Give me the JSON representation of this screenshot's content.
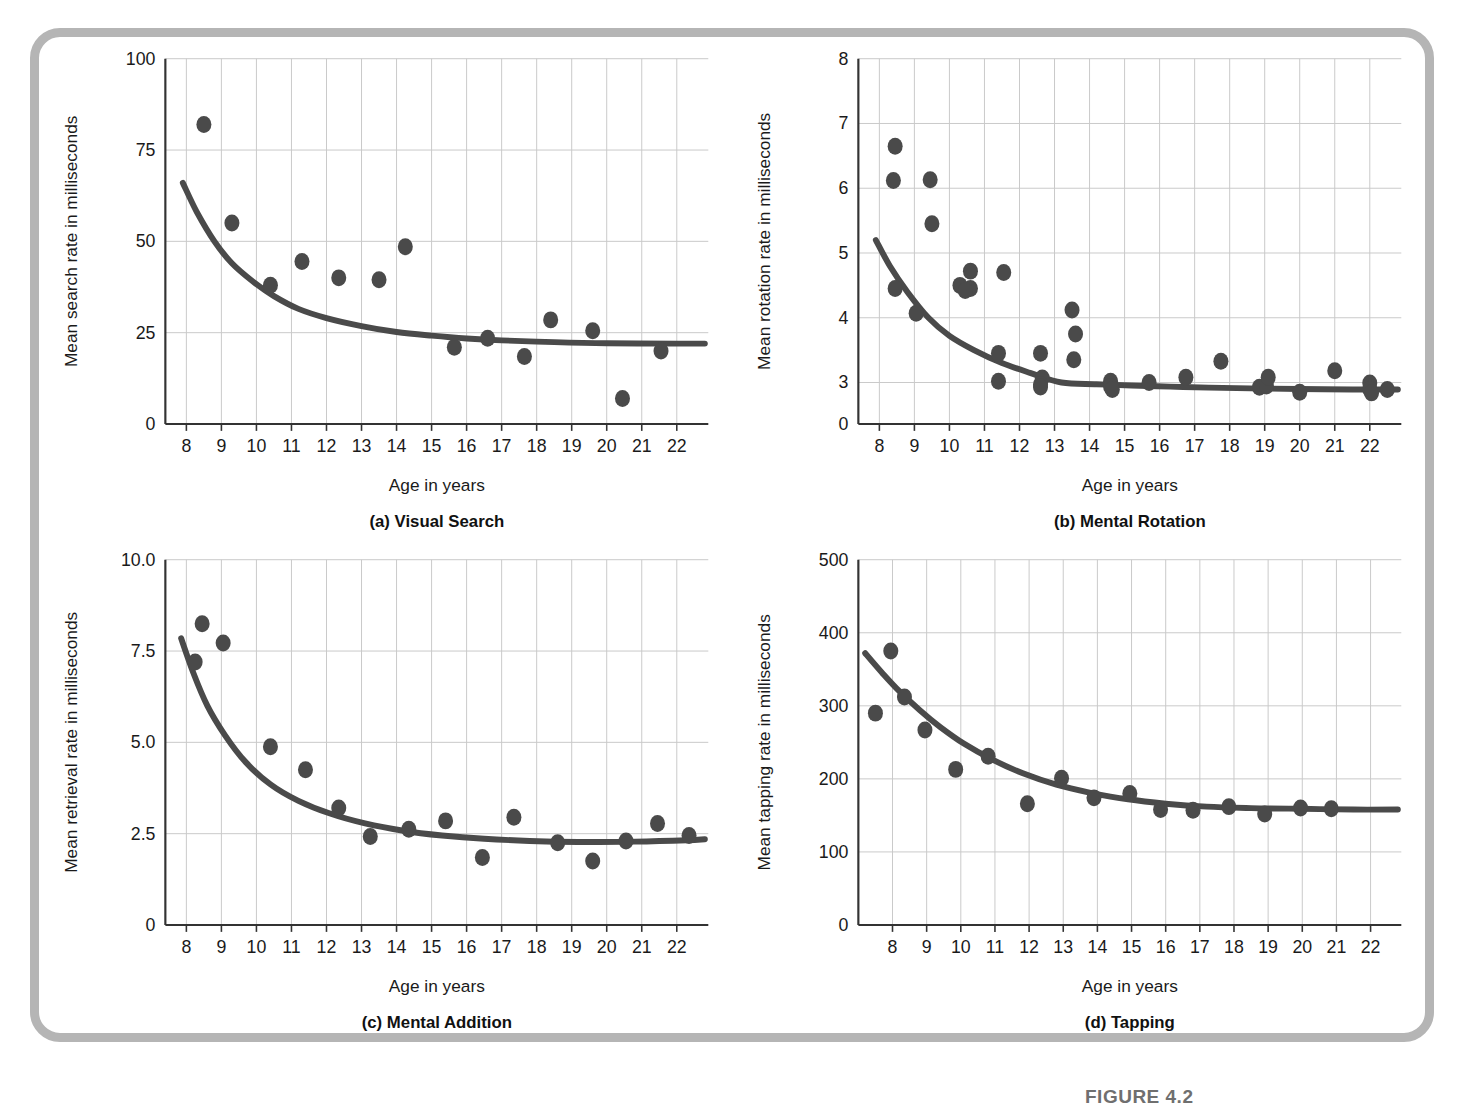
{
  "figure": {
    "caption_label": "FIGURE 4.2",
    "frame_color": "#b5b5b5",
    "marker_color": "#4a4a4a",
    "curve_color": "#4a4a4a",
    "grid_color": "#c9c9c9",
    "axis_color": "#333333"
  },
  "chart_data": [
    {
      "id": "visual-search",
      "type": "scatter",
      "title": "(a) Visual Search",
      "xlabel": "Age in years",
      "ylabel": "Mean search rate in milliseconds",
      "xlim": [
        7.4,
        22.9
      ],
      "ylim": [
        0,
        100
      ],
      "xticks": [
        8,
        9,
        10,
        11,
        12,
        13,
        14,
        15,
        16,
        17,
        18,
        19,
        20,
        21,
        22
      ],
      "yticks": [
        0,
        25,
        50,
        75,
        100
      ],
      "grid": true,
      "legend": "none",
      "points": [
        [
          8.5,
          82
        ],
        [
          9.3,
          55
        ],
        [
          10.4,
          38
        ],
        [
          11.3,
          44.5
        ],
        [
          12.35,
          40
        ],
        [
          13.5,
          39.5
        ],
        [
          14.25,
          48.5
        ],
        [
          15.65,
          21
        ],
        [
          16.6,
          23.5
        ],
        [
          17.65,
          18.5
        ],
        [
          18.4,
          28.5
        ],
        [
          19.6,
          25.5
        ],
        [
          20.45,
          7
        ],
        [
          21.55,
          20
        ]
      ],
      "fit_curve": {
        "model": "exponential-decay",
        "asymptote": 22,
        "points": [
          [
            7.9,
            66
          ],
          [
            8.3,
            58
          ],
          [
            8.8,
            50
          ],
          [
            9.3,
            44
          ],
          [
            9.9,
            39
          ],
          [
            10.5,
            35
          ],
          [
            11.2,
            31.5
          ],
          [
            12.0,
            29
          ],
          [
            13.0,
            26.8
          ],
          [
            14.0,
            25.2
          ],
          [
            15.0,
            24.2
          ],
          [
            16.0,
            23.4
          ],
          [
            17.0,
            22.9
          ],
          [
            18.5,
            22.4
          ],
          [
            20.0,
            22.1
          ],
          [
            22.0,
            22.0
          ],
          [
            22.8,
            22.0
          ]
        ]
      }
    },
    {
      "id": "mental-rotation",
      "type": "scatter",
      "title": "(b) Mental Rotation",
      "xlabel": "Age in years",
      "ylabel": "Mean rotation rate in milliseconds",
      "xlim": [
        7.4,
        22.9
      ],
      "ylim_note": "broken axis: 0 at baseline, then 3 through 8 evenly spaced",
      "xticks": [
        8,
        9,
        10,
        11,
        12,
        13,
        14,
        15,
        16,
        17,
        18,
        19,
        20,
        21,
        22
      ],
      "yticks": [
        0,
        3,
        4,
        5,
        6,
        7,
        8
      ],
      "grid": true,
      "legend": "none",
      "points": [
        [
          8.45,
          6.65
        ],
        [
          8.4,
          6.12
        ],
        [
          8.45,
          4.45
        ],
        [
          9.05,
          4.07
        ],
        [
          9.45,
          6.13
        ],
        [
          9.5,
          5.45
        ],
        [
          10.3,
          4.5
        ],
        [
          10.6,
          4.72
        ],
        [
          10.6,
          4.45
        ],
        [
          10.45,
          4.42
        ],
        [
          11.4,
          3.45
        ],
        [
          11.4,
          3.02
        ],
        [
          11.55,
          4.7
        ],
        [
          12.6,
          3.45
        ],
        [
          12.65,
          3.07
        ],
        [
          12.6,
          2.85
        ],
        [
          12.6,
          2.68
        ],
        [
          13.5,
          4.12
        ],
        [
          13.6,
          3.75
        ],
        [
          13.55,
          3.35
        ],
        [
          14.6,
          3.02
        ],
        [
          14.6,
          2.72
        ],
        [
          14.65,
          2.5
        ],
        [
          15.7,
          3.0
        ],
        [
          16.75,
          3.08
        ],
        [
          17.75,
          3.33
        ],
        [
          18.85,
          2.65
        ],
        [
          19.05,
          2.75
        ],
        [
          19.1,
          3.08
        ],
        [
          20.0,
          2.3
        ],
        [
          21.0,
          3.18
        ],
        [
          22.0,
          2.97
        ],
        [
          22.0,
          2.52
        ],
        [
          22.05,
          2.25
        ],
        [
          22.5,
          2.5
        ]
      ],
      "fit_curve": {
        "model": "exponential-decay",
        "asymptote": 2.5,
        "points": [
          [
            7.9,
            5.2
          ],
          [
            8.3,
            4.8
          ],
          [
            8.8,
            4.4
          ],
          [
            9.4,
            4.0
          ],
          [
            10.0,
            3.72
          ],
          [
            10.7,
            3.5
          ],
          [
            11.5,
            3.3
          ],
          [
            12.3,
            3.15
          ],
          [
            13.2,
            3.0
          ],
          [
            14.2,
            2.88
          ],
          [
            15.2,
            2.78
          ],
          [
            16.3,
            2.7
          ],
          [
            17.4,
            2.63
          ],
          [
            18.6,
            2.58
          ],
          [
            20.0,
            2.53
          ],
          [
            21.5,
            2.5
          ],
          [
            22.8,
            2.5
          ]
        ]
      }
    },
    {
      "id": "mental-addition",
      "type": "scatter",
      "title": "(c) Mental Addition",
      "xlabel": "Age in years",
      "ylabel": "Mean retrieval rate in milliseconds",
      "xlim": [
        7.4,
        22.9
      ],
      "ylim": [
        0,
        10
      ],
      "xticks": [
        8,
        9,
        10,
        11,
        12,
        13,
        14,
        15,
        16,
        17,
        18,
        19,
        20,
        21,
        22
      ],
      "yticks": [
        "0",
        "2.5",
        "5.0",
        "7.5",
        "10.0"
      ],
      "ytick_values": [
        0,
        2.5,
        5.0,
        7.5,
        10.0
      ],
      "grid": true,
      "legend": "none",
      "points": [
        [
          8.45,
          8.25
        ],
        [
          8.25,
          7.2
        ],
        [
          9.05,
          7.72
        ],
        [
          10.4,
          4.88
        ],
        [
          11.4,
          4.25
        ],
        [
          12.35,
          3.2
        ],
        [
          13.25,
          2.42
        ],
        [
          14.35,
          2.62
        ],
        [
          15.4,
          2.85
        ],
        [
          16.45,
          1.85
        ],
        [
          17.35,
          2.95
        ],
        [
          18.6,
          2.25
        ],
        [
          19.6,
          1.75
        ],
        [
          20.55,
          2.3
        ],
        [
          21.45,
          2.78
        ],
        [
          22.35,
          2.45
        ]
      ],
      "fit_curve": {
        "model": "exponential-decay",
        "asymptote": 2.3,
        "points": [
          [
            7.85,
            7.85
          ],
          [
            8.2,
            6.9
          ],
          [
            8.6,
            6.0
          ],
          [
            9.1,
            5.2
          ],
          [
            9.7,
            4.45
          ],
          [
            10.4,
            3.85
          ],
          [
            11.2,
            3.4
          ],
          [
            12.1,
            3.05
          ],
          [
            13.1,
            2.78
          ],
          [
            14.2,
            2.58
          ],
          [
            15.3,
            2.45
          ],
          [
            16.5,
            2.36
          ],
          [
            17.8,
            2.3
          ],
          [
            19.2,
            2.27
          ],
          [
            20.8,
            2.28
          ],
          [
            22.3,
            2.32
          ],
          [
            22.8,
            2.35
          ]
        ]
      }
    },
    {
      "id": "tapping",
      "type": "scatter",
      "title": "(d) Tapping",
      "xlabel": "Age in years",
      "ylabel": "Mean tapping rate in milliseconds",
      "xlim": [
        7.0,
        22.9
      ],
      "ylim": [
        0,
        500
      ],
      "xticks": [
        8,
        9,
        10,
        11,
        12,
        13,
        14,
        15,
        16,
        17,
        18,
        19,
        20,
        21,
        22
      ],
      "yticks": [
        0,
        100,
        200,
        300,
        400,
        500
      ],
      "grid": true,
      "legend": "none",
      "points": [
        [
          7.5,
          290
        ],
        [
          7.95,
          375
        ],
        [
          8.35,
          312
        ],
        [
          8.95,
          267
        ],
        [
          9.85,
          213
        ],
        [
          10.8,
          231
        ],
        [
          11.95,
          166
        ],
        [
          12.95,
          201
        ],
        [
          13.9,
          174
        ],
        [
          14.95,
          180
        ],
        [
          15.85,
          158
        ],
        [
          16.8,
          157
        ],
        [
          17.85,
          162
        ],
        [
          18.9,
          152
        ],
        [
          19.95,
          160
        ],
        [
          20.85,
          159
        ]
      ],
      "fit_curve": {
        "model": "exponential-decay",
        "asymptote": 158,
        "points": [
          [
            7.2,
            372
          ],
          [
            7.7,
            345
          ],
          [
            8.2,
            320
          ],
          [
            8.8,
            294
          ],
          [
            9.4,
            271
          ],
          [
            10.1,
            248
          ],
          [
            10.9,
            227
          ],
          [
            11.8,
            208
          ],
          [
            12.8,
            192
          ],
          [
            13.8,
            181
          ],
          [
            14.9,
            172
          ],
          [
            16.0,
            166
          ],
          [
            17.2,
            162
          ],
          [
            18.5,
            160
          ],
          [
            20.0,
            159
          ],
          [
            21.5,
            158
          ],
          [
            22.8,
            158
          ]
        ]
      }
    }
  ]
}
